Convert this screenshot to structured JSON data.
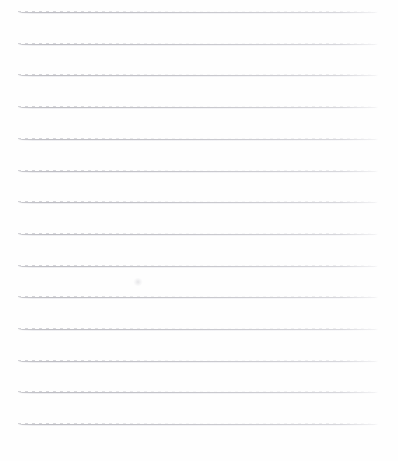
{
  "page": {
    "kind": "scanned-lined-paper",
    "width": 398,
    "height": 461,
    "background_color": "#fefefe",
    "text_content": "",
    "has_handwriting": false,
    "has_printed_text": false
  },
  "rules": {
    "count": 14,
    "line_color": "#c0c0c6",
    "line_thickness_px": 1,
    "left_margin_px": 18,
    "right_margin_px": 20,
    "spacing_px": 31.7,
    "first_line_y_px": 12,
    "lines": [
      {
        "index": 1,
        "y": 12,
        "x_start": 18,
        "x_end": 378
      },
      {
        "index": 2,
        "y": 43.7,
        "x_start": 18,
        "x_end": 378
      },
      {
        "index": 3,
        "y": 75.4,
        "x_start": 18,
        "x_end": 378
      },
      {
        "index": 4,
        "y": 107.1,
        "x_start": 18,
        "x_end": 378
      },
      {
        "index": 5,
        "y": 138.8,
        "x_start": 18,
        "x_end": 378
      },
      {
        "index": 6,
        "y": 170.5,
        "x_start": 18,
        "x_end": 378
      },
      {
        "index": 7,
        "y": 202.2,
        "x_start": 18,
        "x_end": 378
      },
      {
        "index": 8,
        "y": 233.9,
        "x_start": 18,
        "x_end": 378
      },
      {
        "index": 9,
        "y": 265.6,
        "x_start": 18,
        "x_end": 378
      },
      {
        "index": 10,
        "y": 297.3,
        "x_start": 18,
        "x_end": 378
      },
      {
        "index": 11,
        "y": 329.0,
        "x_start": 18,
        "x_end": 378
      },
      {
        "index": 12,
        "y": 360.7,
        "x_start": 18,
        "x_end": 378
      },
      {
        "index": 13,
        "y": 392.4,
        "x_start": 18,
        "x_end": 378
      },
      {
        "index": 14,
        "y": 424.1,
        "x_start": 18,
        "x_end": 378
      }
    ]
  },
  "artifacts": [
    {
      "name": "faint-smudge",
      "x": 133,
      "y": 278,
      "width": 10,
      "height": 8
    }
  ]
}
